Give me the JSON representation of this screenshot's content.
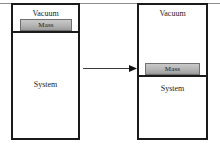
{
  "figure": {
    "type": "process-schematic",
    "panel_count": 2,
    "description_labels": {
      "vacuum": "Vacuum",
      "mass": "Mass",
      "system": "System"
    },
    "colors": {
      "outline": "#1a1a1a",
      "mass_fill": "#b4b4b4",
      "mass_border": "#6f6f6f",
      "background": "#ffffff",
      "rule": "#8d8d8d"
    }
  },
  "panels": [
    {
      "id": "initial-state",
      "position": "left",
      "vessel_label_top": "Vacuum",
      "mass_label": "Mass",
      "vessel_label_bottom": "System",
      "mass_position": "top"
    },
    {
      "id": "final-state",
      "position": "right",
      "vessel_label_top": "Vacuum",
      "mass_label": "Mass",
      "vessel_label_bottom": "System",
      "mass_position": "middle"
    }
  ],
  "arrow": {
    "direction": "right",
    "label": ""
  }
}
